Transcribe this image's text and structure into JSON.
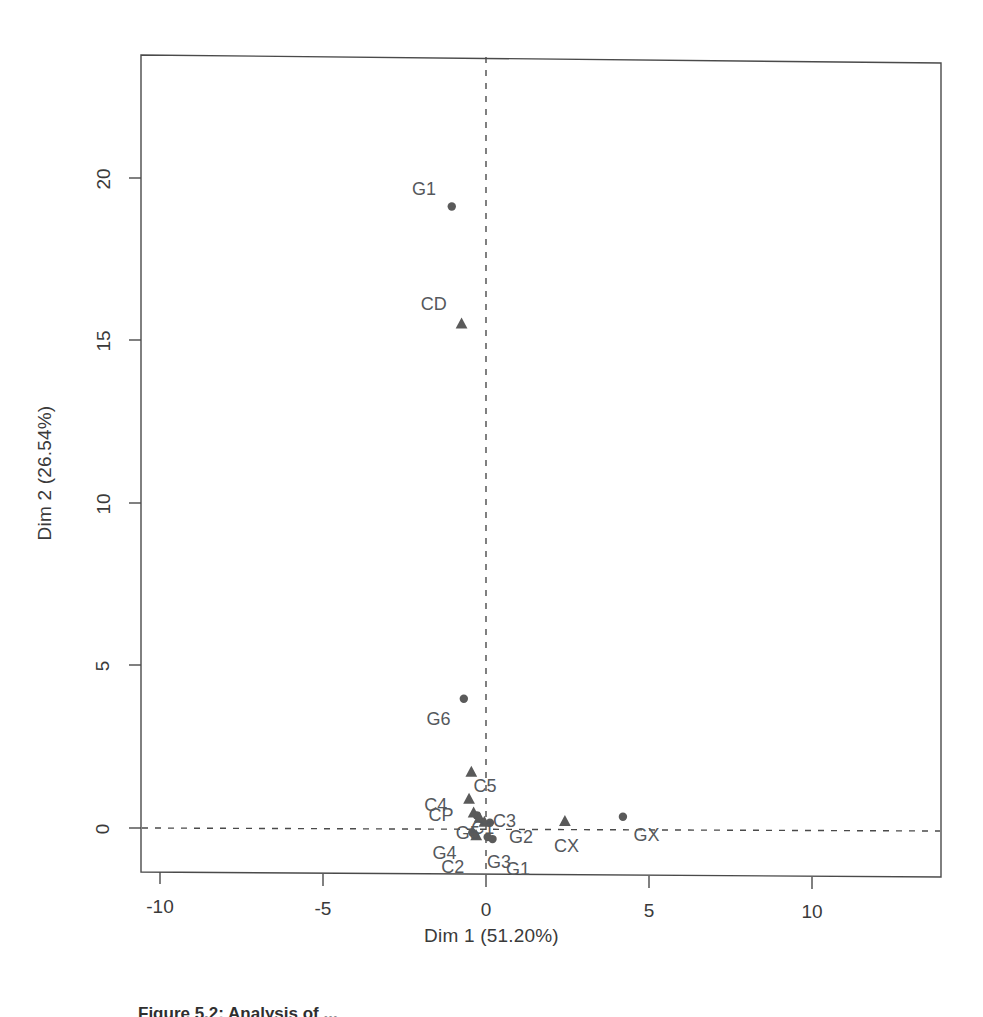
{
  "figure": {
    "caption": "Figure 5.2: Analysis of ..."
  },
  "chart_data": {
    "type": "scatter",
    "title": "",
    "xlabel": "Dim 1 (51.20%)",
    "ylabel": "Dim 2 (26.54%)",
    "xlim": [
      -11.9,
      13.2
    ],
    "ylim": [
      -1.7,
      23.6
    ],
    "xticks": [
      -10,
      -5,
      0,
      5,
      10
    ],
    "xticklabels": [
      "-10",
      "-5",
      "0",
      "5",
      "10"
    ],
    "yticks": [
      0,
      5,
      10,
      15,
      20
    ],
    "yticklabels": [
      "0",
      "5",
      "10",
      "15",
      "20"
    ],
    "grid": false,
    "legend": "none",
    "reference_lines": [
      {
        "axis": "vertical",
        "value": 0,
        "style": "dashed"
      },
      {
        "axis": "horizontal",
        "value": 0,
        "style": "dashed"
      }
    ],
    "marker_color": "#5a5a5a",
    "series": [
      {
        "name": "G",
        "marker": "circle",
        "points": [
          {
            "label": "G1",
            "x": -1.05,
            "y": 19.1,
            "label_dx": -0.85,
            "label_dy": 0.55
          },
          {
            "label": "G6",
            "x": -0.68,
            "y": 4.0,
            "label_dx": -0.78,
            "label_dy": -0.62
          },
          {
            "label": "G5",
            "x": -0.28,
            "y": 0.42,
            "label_dx": -0.28,
            "label_dy": -0.55
          },
          {
            "label": "G2",
            "x": 0.12,
            "y": 0.2,
            "label_dx": 0.95,
            "label_dy": -0.42
          },
          {
            "label": "G4",
            "x": -0.42,
            "y": -0.1,
            "label_dx": -0.85,
            "label_dy": -0.62
          },
          {
            "label": "G3",
            "x": 0.05,
            "y": -0.24,
            "label_dx": 0.35,
            "label_dy": -0.75
          },
          {
            "label": "G1b",
            "x": 0.2,
            "y": -0.3,
            "label_dx": 0.78,
            "label_dy": -0.9
          },
          {
            "label": "GX",
            "x": 4.2,
            "y": 0.4,
            "label_dx": 0.72,
            "label_dy": -0.55
          }
        ]
      },
      {
        "name": "C",
        "marker": "triangle",
        "points": [
          {
            "label": "CD",
            "x": -0.75,
            "y": 15.5,
            "label_dx": -0.85,
            "label_dy": 0.62
          },
          {
            "label": "C5",
            "x": -0.45,
            "y": 1.75,
            "label_dx": 0.42,
            "label_dy": -0.42
          },
          {
            "label": "C4",
            "x": -0.52,
            "y": 0.92,
            "label_dx": -1.02,
            "label_dy": -0.18
          },
          {
            "label": "CP",
            "x": -0.38,
            "y": 0.5,
            "label_dx": -1.0,
            "label_dy": -0.08
          },
          {
            "label": "C1",
            "x": -0.2,
            "y": 0.35,
            "label_dx": 0.1,
            "label_dy": -0.3
          },
          {
            "label": "C3",
            "x": -0.05,
            "y": 0.22,
            "label_dx": 0.62,
            "label_dy": 0.05
          },
          {
            "label": "C2",
            "x": -0.3,
            "y": -0.2,
            "label_dx": -0.72,
            "label_dy": -0.95
          },
          {
            "label": "CX",
            "x": 2.42,
            "y": 0.25,
            "label_dx": 0.05,
            "label_dy": -0.75
          }
        ]
      }
    ]
  }
}
